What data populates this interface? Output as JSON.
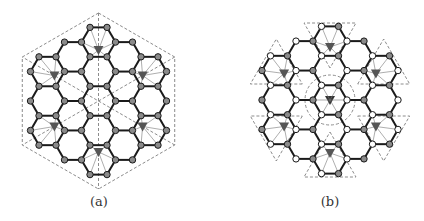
{
  "panels": [
    {
      "id": "a",
      "caption": "(a)",
      "center": [
        98.5,
        101
      ],
      "hex_side": 17,
      "rings": 2,
      "node_style": "gray",
      "outline": {
        "type": "hexagon",
        "radius": 88,
        "dashed": true
      },
      "center_dashed_lines": true,
      "triangles": [
        {
          "dir": 0
        },
        {
          "dir": 1
        },
        {
          "dir": 2
        },
        {
          "dir": 3
        },
        {
          "dir": 4
        },
        {
          "dir": 5
        }
      ]
    },
    {
      "id": "b",
      "caption": "(b)",
      "center": [
        330,
        100
      ],
      "hex_side": 17,
      "rings": 2,
      "node_style": "bipartite",
      "outline": {
        "type": "triangles",
        "dashed": true
      },
      "center_circle_radius": 25,
      "triangles": [
        {
          "dir": 0
        },
        {
          "dir": 1
        },
        {
          "dir": 2
        },
        {
          "dir": 3
        },
        {
          "dir": 4
        },
        {
          "dir": 5
        }
      ]
    }
  ],
  "colors": {
    "edge": "#1a1a1a",
    "node_gray": "#8a8a8a",
    "node_white": "#ffffff",
    "node_stroke": "#1a1a1a",
    "triangle": "#555555",
    "dashed": "#8c8c8c",
    "thin": "#777777"
  }
}
